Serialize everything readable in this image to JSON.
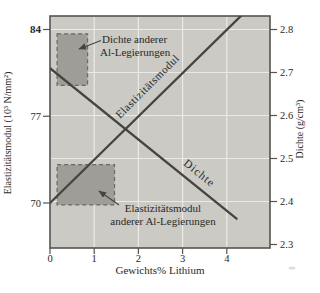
{
  "colors": {
    "background": "#ffffff",
    "plot_bg": "#cbcac5",
    "grid": "#ebeae5",
    "frame": "#55544e",
    "line": "#45443f",
    "region_fill": "#9e9d98",
    "region_border": "#6a6962",
    "text": "#2a2924"
  },
  "chart_data": {
    "type": "line",
    "title": "",
    "xlabel": "Gewichts% Lithium",
    "ylabel_left": "Elastizitätsmodul (10³ N/mm²)",
    "ylabel_right": "Dichte (g/cm³)",
    "x_axis": {
      "min": 0,
      "max": 4.95,
      "ticks": [
        0,
        1,
        2,
        3,
        4
      ]
    },
    "left_axis": {
      "ticks": [
        70,
        77,
        84
      ],
      "emphasized_tick": 84,
      "range_shown": [
        66.4,
        85.1
      ]
    },
    "right_axis": {
      "ticks": [
        2.3,
        2.4,
        2.5,
        2.6,
        2.7,
        2.8
      ],
      "range_shown": [
        2.29,
        2.83
      ]
    },
    "grid": {
      "vertical_x": [
        1,
        2,
        3,
        4
      ],
      "horizontal_density": [
        2.4,
        2.5,
        2.6,
        2.7,
        2.8
      ]
    },
    "series": [
      {
        "name": "elastizitaetsmodul",
        "label": "Elastizitätsmodul",
        "axis": "left",
        "points": [
          [
            0,
            70.0
          ],
          [
            4.35,
            85.2
          ]
        ]
      },
      {
        "name": "dichte",
        "label": "Dichte",
        "axis": "right",
        "points": [
          [
            0,
            2.71
          ],
          [
            4.22,
            2.36
          ]
        ]
      }
    ],
    "regions": [
      {
        "name": "density-other-alloys",
        "axis": "right",
        "x": [
          0.16,
          0.85
        ],
        "range": [
          2.67,
          2.79
        ]
      },
      {
        "name": "modulus-other-alloys",
        "axis": "left",
        "x": [
          0.16,
          1.46
        ],
        "range": [
          69.85,
          73.1
        ]
      }
    ],
    "annotations": {
      "density_region_label": [
        "Dichte anderer",
        "Al-Legierungen"
      ],
      "modulus_region_label": [
        "Elastizitätsmodul",
        "anderer Al-Legierungen"
      ]
    },
    "legend": "none",
    "grid_on": true
  }
}
